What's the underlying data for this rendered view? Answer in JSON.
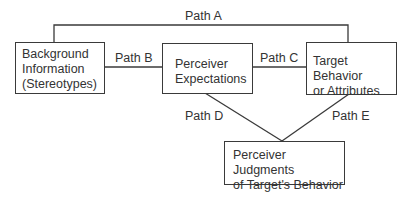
{
  "diagram": {
    "nodes": [
      {
        "id": "background",
        "lines": [
          "Background",
          "Information",
          "(Stereotypes)"
        ]
      },
      {
        "id": "expectations",
        "lines": [
          "Perceiver",
          "Expectations"
        ]
      },
      {
        "id": "target",
        "lines": [
          "Target Behavior",
          "or Attributes"
        ]
      },
      {
        "id": "judgments",
        "lines": [
          "Perceiver Judgments",
          "of Target's Behavior"
        ]
      }
    ],
    "edges": [
      {
        "label": "Path A",
        "from": "background",
        "to": "target"
      },
      {
        "label": "Path B",
        "from": "background",
        "to": "expectations"
      },
      {
        "label": "Path C",
        "from": "expectations",
        "to": "target"
      },
      {
        "label": "Path D",
        "from": "expectations",
        "to": "judgments"
      },
      {
        "label": "Path E",
        "from": "target",
        "to": "judgments"
      }
    ]
  }
}
